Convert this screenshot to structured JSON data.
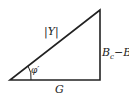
{
  "diagram": {
    "type": "right-triangle",
    "hypotenuse_label": "|Y|",
    "base_label": "G",
    "side_label": {
      "main": "B",
      "sub1": "c",
      "minus": "−",
      "main2": "B",
      "sub2": "L"
    },
    "angle_label": "φ′",
    "stroke_color": "#222222"
  }
}
